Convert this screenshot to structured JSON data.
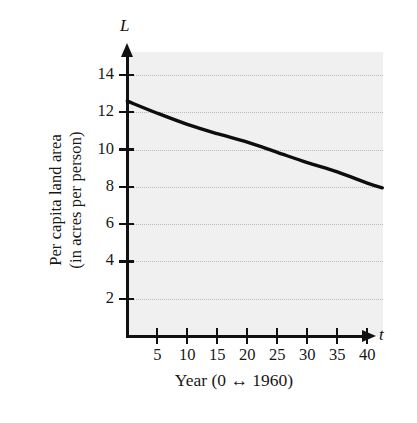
{
  "chart_data": {
    "type": "line",
    "title": "",
    "subtitle": "",
    "xlabel": "Year (0 ↔ 1960)",
    "ylabel_line_1": "Per capita land area",
    "ylabel_line_2": "(in acres per person)",
    "x_axis_variable": "t",
    "y_axis_variable": "L",
    "xlim": [
      0,
      42.5
    ],
    "ylim": [
      0,
      15
    ],
    "xticks": [
      5,
      10,
      15,
      20,
      25,
      30,
      35,
      40
    ],
    "yticks": [
      2,
      4,
      6,
      8,
      10,
      12,
      14
    ],
    "xtick_labels": [
      "5",
      "10",
      "15",
      "20",
      "25",
      "30",
      "35",
      "40"
    ],
    "ytick_labels": [
      "2",
      "4",
      "6",
      "8",
      "10",
      "12",
      "14"
    ],
    "grid": true,
    "grid_axis": "y",
    "grid_style": "dotted",
    "legend": false,
    "legend_position": "none",
    "series": [
      {
        "name": "Per capita land area",
        "color": "#0d0d0d",
        "line_width": 3.4,
        "x": [
          0,
          5,
          10,
          15,
          20,
          25,
          30,
          35,
          40,
          42.5
        ],
        "values": [
          12.6,
          11.95,
          11.35,
          10.85,
          10.4,
          9.85,
          9.3,
          8.8,
          8.2,
          7.95
        ]
      }
    ],
    "annotations": [],
    "colors": {
      "plot_background": "#f0f0f0",
      "page_background": "#ffffff",
      "axis": "#111111",
      "gridline": "#b9b9b9",
      "curve": "#0d0d0d",
      "text": "#171717"
    }
  },
  "axis_icons": {
    "y_arrow": "arrow-up-icon",
    "x_arrow": "arrow-right-icon",
    "xlabel_double_arrow": "left-right-arrow-icon"
  }
}
